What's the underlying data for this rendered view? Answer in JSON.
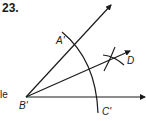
{
  "problem_number": "23.",
  "margin_fragment": "le",
  "points": {
    "vertex": "B'",
    "upper": "A'",
    "lower": "C'",
    "bisector": "D"
  },
  "colors": {
    "stroke": "#1a1a1a",
    "background": "#ffffff"
  }
}
